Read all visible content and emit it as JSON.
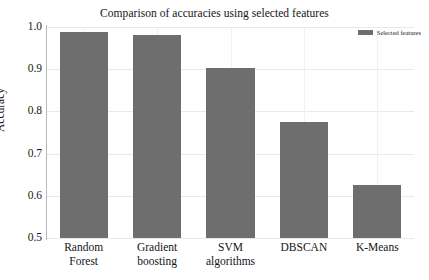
{
  "chart_data": {
    "type": "bar",
    "title": "Comparison of accuracies using selected features",
    "xlabel": "",
    "ylabel": "Accuracy",
    "categories": [
      "Random Forest",
      "Gradient boosting",
      "SVM algorithms",
      "DBSCAN",
      "K-Means"
    ],
    "category_lines": [
      [
        "Random",
        "Forest"
      ],
      [
        "Gradient",
        "boosting"
      ],
      [
        "SVM",
        "algorithms"
      ],
      [
        "DBSCAN",
        ""
      ],
      [
        "K-Means",
        ""
      ]
    ],
    "values": [
      0.988,
      0.981,
      0.903,
      0.775,
      0.625
    ],
    "series": [
      {
        "name": "Selected features",
        "values": [
          0.988,
          0.981,
          0.903,
          0.775,
          0.625
        ],
        "color": "#6e6e6e"
      }
    ],
    "ylim": [
      0.5,
      1.0
    ],
    "yticks": [
      1.0,
      0.9,
      0.8,
      0.7,
      0.6,
      0.5
    ],
    "ytick_labels": [
      "1.0",
      "0.9",
      "0.8",
      "0.7",
      "0.6",
      "0.5"
    ],
    "grid": true,
    "grid_axis": "both",
    "legend": {
      "position": "upper right",
      "entries": [
        {
          "label": "Selected features",
          "color": "#6e6e6e"
        }
      ]
    },
    "bar_color": "#6e6e6e",
    "background_color": "#ffffff",
    "axis_color": "#b8b8b8",
    "grid_color": "#e9e9e9"
  }
}
